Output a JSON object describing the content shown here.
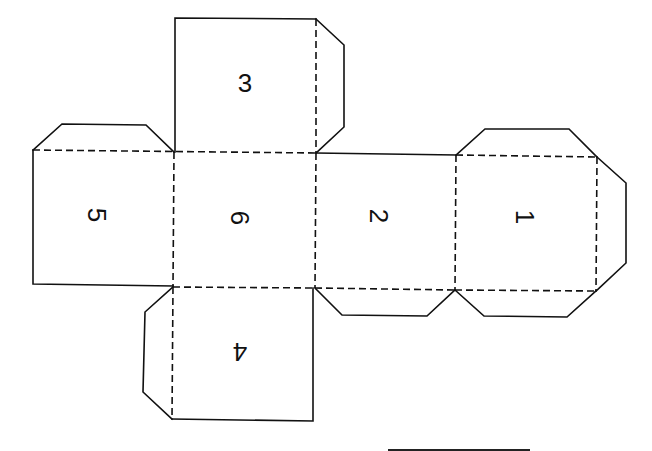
{
  "diagram": {
    "title": "",
    "type": "cube-net",
    "line_color": "#111111",
    "background": "#ffffff",
    "faces": [
      {
        "id": "face-3",
        "label": "3",
        "rotation": "0",
        "position": "top"
      },
      {
        "id": "face-5",
        "label": "5",
        "rotation": "90",
        "position": "left"
      },
      {
        "id": "face-6",
        "label": "6",
        "rotation": "90",
        "position": "center"
      },
      {
        "id": "face-2",
        "label": "2",
        "rotation": "90",
        "position": "right-of-center"
      },
      {
        "id": "face-1",
        "label": "1",
        "rotation": "90",
        "position": "far-right"
      },
      {
        "id": "face-4",
        "label": "4",
        "rotation": "180",
        "position": "bottom"
      }
    ],
    "legend": {
      "solid_line": "cut",
      "dashed_line": "fold"
    }
  }
}
